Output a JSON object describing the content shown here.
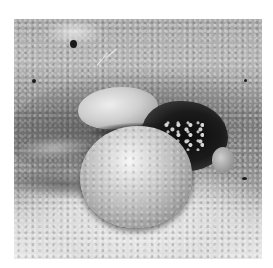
{
  "image": {
    "kind": "grayscale clinical photograph",
    "frame": {
      "x": 14,
      "y": 19,
      "width": 248,
      "height": 240
    },
    "background_color": "#ffffff",
    "regions": [
      {
        "name": "upper-pale-mass",
        "tone": "light gray"
      },
      {
        "name": "dark-necrotic-region",
        "tone": "near black"
      },
      {
        "name": "spherical-mass",
        "tone": "light gray highlight"
      },
      {
        "name": "right-small-nodule",
        "tone": "mid gray"
      },
      {
        "name": "surrounding-skin",
        "tone": "textured gray"
      }
    ],
    "palette": {
      "highlight": "#f6f6f6",
      "mid": "#a0a0a0",
      "shadow": "#1b1b1b",
      "border": "#ffffff"
    }
  }
}
